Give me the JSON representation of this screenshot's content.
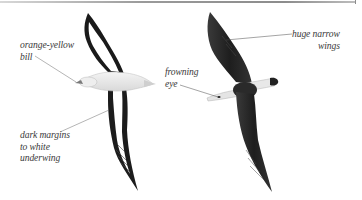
{
  "figure": {
    "views": [
      {
        "name": "underside view",
        "palette": {
          "wing_margin": "#1a1a1a",
          "underwing": "#ffffff",
          "body": "#e6e6e6"
        }
      },
      {
        "name": "upperside view",
        "palette": {
          "wing": "#2b2b2b",
          "tail": "#e8e8e8",
          "tail_tip": "#222222"
        }
      }
    ],
    "colors": {
      "rule": "#9a9a9a",
      "leader_line": "#6a6a6a",
      "label_text": "#3a3a3a",
      "background": "#ffffff"
    }
  },
  "labels": {
    "bill": {
      "line1": "orange-yellow",
      "line2": "bill"
    },
    "margins": {
      "line1": "dark margins",
      "line2": "to white",
      "line3": "underwing"
    },
    "eye": {
      "line1": "frowning",
      "line2": "eye"
    },
    "wings": {
      "line1": "huge narrow",
      "line2": "wings"
    }
  }
}
